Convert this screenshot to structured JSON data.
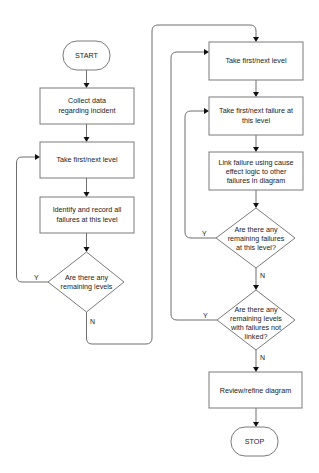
{
  "diagram": {
    "type": "flowchart",
    "nodes": {
      "start": {
        "shape": "terminal",
        "lines": [
          "START"
        ]
      },
      "collect": {
        "shape": "process",
        "lines": [
          "Collect data",
          "regarding incident"
        ]
      },
      "take_level_left": {
        "shape": "process",
        "lines": [
          "Take first/next level"
        ]
      },
      "identify": {
        "shape": "process",
        "lines": [
          "Identify and record all",
          "failures at this level"
        ]
      },
      "remaining_levels": {
        "shape": "decision",
        "lines": [
          "Are there any",
          "remaining levels"
        ]
      },
      "take_level_right": {
        "shape": "process",
        "lines": [
          "Take first/next level"
        ]
      },
      "take_failure": {
        "shape": "process",
        "lines": [
          "Take first/next failure at",
          "this level"
        ]
      },
      "link_failure": {
        "shape": "process",
        "lines": [
          "Link failure using cause",
          "effect logic to other",
          "failures in diagram"
        ]
      },
      "remaining_failures": {
        "shape": "decision",
        "lines": [
          "Are there any",
          "remaining failures",
          "at this level?"
        ]
      },
      "remaining_unlinked": {
        "shape": "decision",
        "lines": [
          "Are there any",
          "remaining levels",
          "with failures not",
          "linked?"
        ]
      },
      "review": {
        "shape": "process",
        "lines": [
          "Review/refine diagram"
        ]
      },
      "stop": {
        "shape": "terminal",
        "lines": [
          "STOP"
        ]
      }
    },
    "edges": [
      {
        "from": "start",
        "to": "collect",
        "label": ""
      },
      {
        "from": "collect",
        "to": "take_level_left",
        "label": ""
      },
      {
        "from": "take_level_left",
        "to": "identify",
        "label": ""
      },
      {
        "from": "identify",
        "to": "remaining_levels",
        "label": ""
      },
      {
        "from": "remaining_levels",
        "to": "take_level_left",
        "label": "Y"
      },
      {
        "from": "remaining_levels",
        "to": "take_level_right",
        "label": "N"
      },
      {
        "from": "take_level_right",
        "to": "take_failure",
        "label": ""
      },
      {
        "from": "take_failure",
        "to": "link_failure",
        "label": ""
      },
      {
        "from": "link_failure",
        "to": "remaining_failures",
        "label": ""
      },
      {
        "from": "remaining_failures",
        "to": "take_failure",
        "label": "Y"
      },
      {
        "from": "remaining_failures",
        "to": "remaining_unlinked",
        "label": "N"
      },
      {
        "from": "remaining_unlinked",
        "to": "take_level_right",
        "label": "Y"
      },
      {
        "from": "remaining_unlinked",
        "to": "review",
        "label": "N"
      },
      {
        "from": "review",
        "to": "stop",
        "label": ""
      }
    ],
    "labels": {
      "yes": "Y",
      "no": "N"
    }
  }
}
